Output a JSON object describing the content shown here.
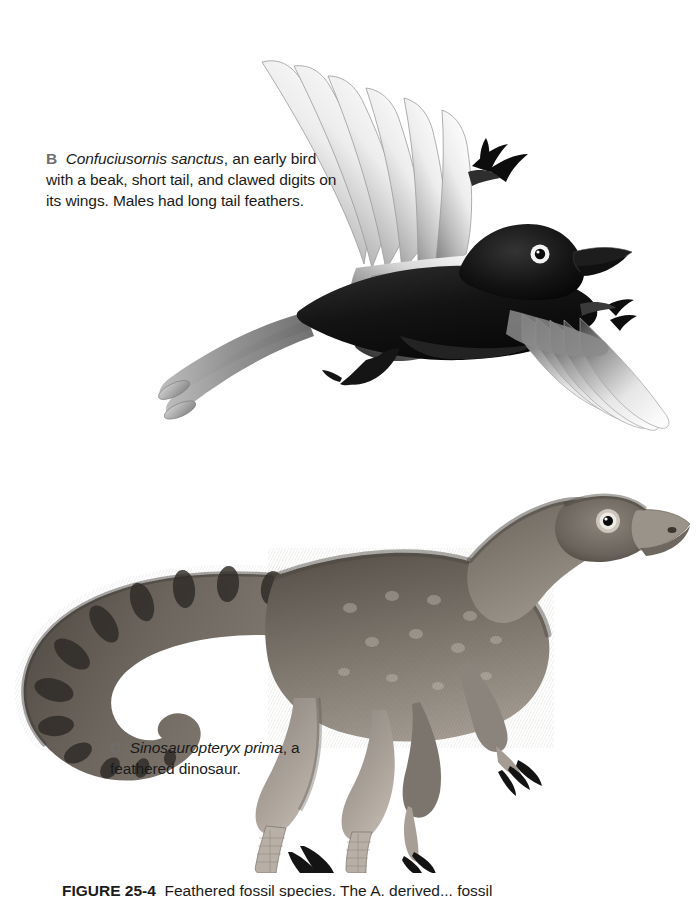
{
  "figure": {
    "panels": [
      {
        "letter": "B",
        "species_italic": "Confuciusornis sanctus",
        "description": ", an early bird with a beak, short tail, and clawed digits on its wings. Males had long tail feathers.",
        "subject": "confuciusornis-flying",
        "text_full": "B Confuciusornis sanctus, an early bird with a beak, short tail, and clawed digits on its wings. Males had long tail feathers."
      },
      {
        "letter": "C",
        "species_italic": "Sinosauropteryx prima",
        "description": ", a feathered dinosaur.",
        "subject": "sinosauropteryx-standing",
        "text_full": "C Sinosauropteryx prima, a feathered dinosaur."
      }
    ],
    "bottom_caption": {
      "label": "FIGURE 25-4",
      "text": "Feathered fossil species. The A. derived... fossil"
    }
  },
  "colors": {
    "background": "#ffffff",
    "text": "#1b1b1b",
    "panel_letter": "#6e6e6e",
    "bird_body_dark": "#161616",
    "bird_wing_light": "#f2f2f2",
    "bird_wing_mid": "#8e8e8e",
    "dino_body": "#6e675f",
    "dino_body_dark": "#3d3833",
    "dino_light": "#b6afa6",
    "claw_black": "#111111"
  }
}
